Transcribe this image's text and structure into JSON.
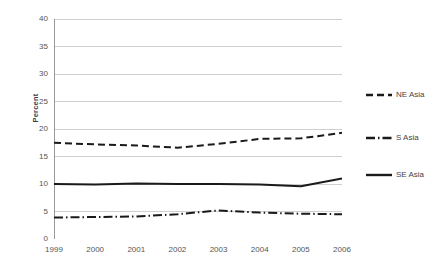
{
  "chart_data": {
    "type": "line",
    "title": "",
    "xlabel": "",
    "ylabel": "Percent",
    "x": [
      1999,
      2000,
      2001,
      2002,
      2003,
      2004,
      2005,
      2006
    ],
    "categories": [
      "1999",
      "2000",
      "2001",
      "2002",
      "2003",
      "2004",
      "2005",
      "2006"
    ],
    "xlim": [
      1999,
      2006
    ],
    "ylim": [
      0,
      40
    ],
    "yticks": [
      0,
      5,
      10,
      15,
      20,
      25,
      30,
      35,
      40
    ],
    "ytick_labels": [
      "0",
      "5",
      "10",
      "15",
      "20",
      "25",
      "30",
      "35",
      "40"
    ],
    "grid": "horizontal",
    "legend_position": "right",
    "series": [
      {
        "name": "NE Asia",
        "style": "dashed",
        "color": "#1a1a1a",
        "values": [
          17.5,
          17.2,
          17.0,
          16.6,
          17.3,
          18.2,
          18.3,
          19.3
        ]
      },
      {
        "name": "S Asia",
        "style": "dash-dot",
        "color": "#1a1a1a",
        "values": [
          3.9,
          4.0,
          4.1,
          4.5,
          5.2,
          4.8,
          4.6,
          4.5
        ]
      },
      {
        "name": "SE Asia",
        "style": "solid",
        "color": "#1a1a1a",
        "values": [
          10.0,
          9.9,
          10.1,
          10.0,
          10.0,
          9.9,
          9.6,
          11.0
        ]
      }
    ]
  },
  "axes": {
    "y_title": "Percent",
    "y_ticks": [
      "40",
      "35",
      "30",
      "25",
      "20",
      "15",
      "10",
      "5",
      "0"
    ],
    "x_ticks": [
      "1999",
      "2000",
      "2001",
      "2002",
      "2003",
      "2004",
      "2005",
      "2006"
    ]
  },
  "legend": {
    "items": [
      {
        "label": "NE Asia",
        "style": "dashed"
      },
      {
        "label": "S Asia",
        "style": "dash-dot"
      },
      {
        "label": "SE Asia",
        "style": "solid"
      }
    ]
  },
  "colors": {
    "line": "#1a1a1a",
    "grid": "#d0d0d0",
    "axis": "#b0b0b0",
    "text": "#555555"
  }
}
